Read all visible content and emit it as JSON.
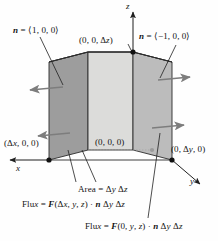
{
  "figure": {
    "labels": {
      "n_left": "n = ⟨1, 0, 0⟩",
      "n_right": "n = ⟨−1, 0, 0⟩",
      "top_vertex": "(0, 0, Δz)",
      "origin": "(0, 0, 0)",
      "x_vertex": "(Δx, 0, 0)",
      "y_vertex": "(0, Δy, 0)",
      "area": "Area = Δy Δz",
      "flux_front": "Flux = F(Δx, y, z) · n Δy Δz",
      "flux_back": "Flux = F(0, y, z) · n Δy Δz"
    },
    "axes": {
      "x": "x",
      "y": "y",
      "z": "z"
    },
    "colors": {
      "face_left": "#9e9e9e",
      "face_front": "#d8d8d6",
      "face_right": "#bdbdbd",
      "face_top": "#cfcfcd",
      "edge": "#2b2b2b",
      "arrow": "#7d7d7d",
      "leader": "#1f1f1f",
      "vertex_dot": "#111111",
      "origin_dot": "#9a9a9a",
      "background": "#fefefe"
    }
  }
}
